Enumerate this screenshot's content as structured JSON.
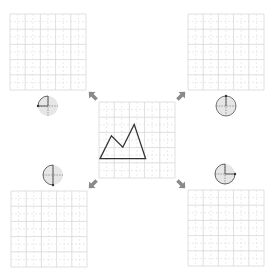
{
  "diagram": {
    "type": "rotation-exercise",
    "center_grid": {
      "x": 99,
      "y": 102,
      "size": 76,
      "cells": 5
    },
    "shape": {
      "name": "mountain-polygon",
      "points_grid": [
        [
          0,
          4
        ],
        [
          1,
          2
        ],
        [
          2,
          3
        ],
        [
          3,
          1
        ],
        [
          4,
          4
        ]
      ],
      "stroke": "#333333"
    },
    "target_grids": [
      {
        "id": "top-left",
        "x": 10,
        "y": 14,
        "size": 76,
        "cells": 5
      },
      {
        "id": "top-right",
        "x": 188,
        "y": 14,
        "size": 76,
        "cells": 5
      },
      {
        "id": "bottom-left",
        "x": 11,
        "y": 191,
        "size": 76,
        "cells": 5
      },
      {
        "id": "bottom-right",
        "x": 188,
        "y": 190,
        "size": 76,
        "cells": 5
      }
    ],
    "rotation_indicators": [
      {
        "id": "top-left",
        "cx": 48,
        "cy": 106,
        "arc": "quarter",
        "label": "90° counterclockwise"
      },
      {
        "id": "top-right",
        "cx": 226,
        "cy": 106,
        "arc": "full",
        "label": "360°"
      },
      {
        "id": "bottom-left",
        "cx": 53,
        "cy": 175,
        "arc": "half",
        "label": "180° counterclockwise"
      },
      {
        "id": "bottom-right",
        "cx": 225,
        "cy": 174,
        "arc": "three-quarter",
        "label": "270° counterclockwise"
      }
    ],
    "arrows": [
      {
        "id": "up-left",
        "x": 93,
        "y": 96,
        "direction": "up-left"
      },
      {
        "id": "up-right",
        "x": 181,
        "y": 96,
        "direction": "up-right"
      },
      {
        "id": "down-left",
        "x": 93,
        "y": 184,
        "direction": "down-left"
      },
      {
        "id": "down-right",
        "x": 181,
        "y": 184,
        "direction": "down-right"
      }
    ],
    "colors": {
      "grid_major": "#d8d8d8",
      "grid_minor": "#e6e6e6",
      "arrow": "#8a8a8a",
      "indicator_fill": "#e6e6e6",
      "indicator_stroke": "#555555"
    }
  }
}
